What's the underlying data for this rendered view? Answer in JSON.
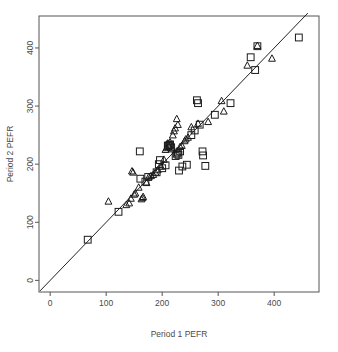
{
  "chart_data": {
    "type": "scatter",
    "title": "",
    "xlabel": "Period 1 PEFR",
    "ylabel": "Period 2 PEFR",
    "xlim": [
      -20,
      480
    ],
    "ylim": [
      -20,
      455
    ],
    "xticks": [
      0,
      100,
      200,
      300,
      400
    ],
    "yticks": [
      0,
      100,
      200,
      300,
      400
    ],
    "xtick_labels": [
      "0",
      "100",
      "200",
      "300",
      "400"
    ],
    "ytick_labels": [
      "0",
      "100",
      "200",
      "300",
      "400"
    ],
    "grid": false,
    "legend": "none",
    "reference_line": {
      "name": "identity-line",
      "type": "line",
      "slope": 1,
      "intercept": 0,
      "x_from": -18,
      "x_to": 460,
      "color": "#222222"
    },
    "series": [
      {
        "name": "Wright mini meter",
        "marker": "square",
        "color": "#1a1a1a",
        "points": [
          [
            67,
            70
          ],
          [
            122,
            118
          ],
          [
            160,
            222
          ],
          [
            161,
            175
          ],
          [
            170,
            170
          ],
          [
            175,
            178
          ],
          [
            190,
            186
          ],
          [
            194,
            200
          ],
          [
            196,
            207
          ],
          [
            200,
            193
          ],
          [
            206,
            198
          ],
          [
            210,
            232
          ],
          [
            211,
            231
          ],
          [
            213,
            233
          ],
          [
            214,
            234
          ],
          [
            216,
            229
          ],
          [
            224,
            214
          ],
          [
            226,
            218
          ],
          [
            228,
            220
          ],
          [
            229,
            216
          ],
          [
            230,
            189
          ],
          [
            232,
            222
          ],
          [
            236,
            196
          ],
          [
            244,
            199
          ],
          [
            252,
            250
          ],
          [
            258,
            258
          ],
          [
            262,
            310
          ],
          [
            264,
            305
          ],
          [
            267,
            268
          ],
          [
            272,
            222
          ],
          [
            273,
            215
          ],
          [
            277,
            197
          ],
          [
            294,
            285
          ],
          [
            322,
            305
          ],
          [
            358,
            384
          ],
          [
            366,
            362
          ],
          [
            370,
            403
          ],
          [
            444,
            418
          ]
        ]
      },
      {
        "name": "Wright standard meter",
        "marker": "triangle",
        "color": "#1a1a1a",
        "points": [
          [
            104,
            136
          ],
          [
            136,
            130
          ],
          [
            141,
            133
          ],
          [
            144,
            141
          ],
          [
            146,
            188
          ],
          [
            148,
            186
          ],
          [
            150,
            148
          ],
          [
            152,
            150
          ],
          [
            158,
            160
          ],
          [
            163,
            140
          ],
          [
            165,
            142
          ],
          [
            166,
            144
          ],
          [
            172,
            168
          ],
          [
            176,
            178
          ],
          [
            180,
            180
          ],
          [
            184,
            182
          ],
          [
            188,
            186
          ],
          [
            192,
            190
          ],
          [
            198,
            196
          ],
          [
            203,
            208
          ],
          [
            206,
            225
          ],
          [
            208,
            228
          ],
          [
            210,
            236
          ],
          [
            212,
            230
          ],
          [
            214,
            238
          ],
          [
            217,
            226
          ],
          [
            219,
            250
          ],
          [
            221,
            257
          ],
          [
            223,
            262
          ],
          [
            226,
            278
          ],
          [
            228,
            268
          ],
          [
            232,
            230
          ],
          [
            235,
            232
          ],
          [
            240,
            240
          ],
          [
            242,
            243
          ],
          [
            246,
            246
          ],
          [
            252,
            264
          ],
          [
            264,
            270
          ],
          [
            282,
            273
          ],
          [
            306,
            309
          ],
          [
            310,
            291
          ],
          [
            352,
            370
          ],
          [
            370,
            404
          ],
          [
            396,
            382
          ]
        ]
      }
    ]
  }
}
